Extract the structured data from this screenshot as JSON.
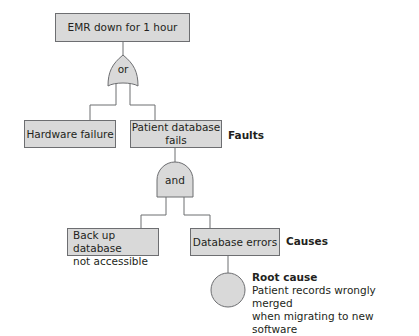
{
  "top_event": "EMR down for 1 hour",
  "gates": {
    "or": "or",
    "and": "and"
  },
  "faults": {
    "hardware": "Hardware failure",
    "patient_db_line1": "Patient database",
    "patient_db_line2": "fails",
    "label": "Faults"
  },
  "causes": {
    "backup_line1": "Back up database",
    "backup_line2": "not accessible",
    "db_errors": "Database errors",
    "label": "Causes"
  },
  "root_cause": {
    "title": "Root cause",
    "line1": "Patient records wrongly merged",
    "line2": "when migrating to new software"
  },
  "colors": {
    "fill": "#d9d9d9",
    "stroke": "#6d6e71"
  }
}
